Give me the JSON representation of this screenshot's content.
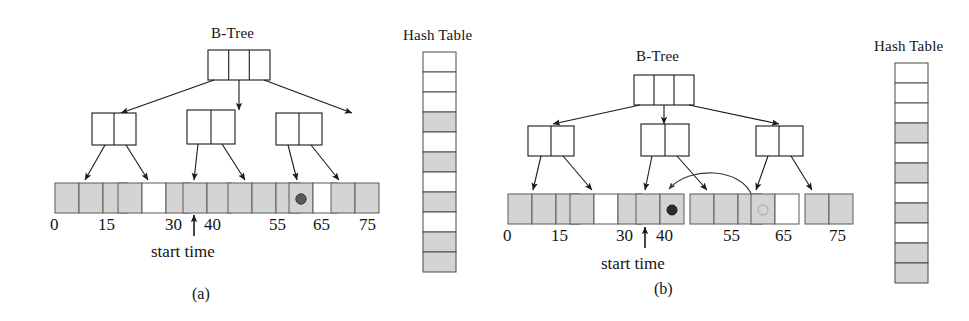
{
  "figure": {
    "type": "diagram",
    "background_color": "#ffffff",
    "ink_color": "#1a1a1a",
    "cell_fill_gray": "#d4d4d4",
    "cell_fill_white": "#ffffff",
    "dot_color": "#3a3a3a",
    "panels": [
      {
        "id": "a",
        "caption": "(a)",
        "btree_label": "B-Tree",
        "hash_label": "Hash Table",
        "start_time_label": "start time",
        "axis_ticks": [
          "0",
          "15",
          "30",
          "40",
          "55",
          "65",
          "75"
        ],
        "root": {
          "slots": 3
        },
        "internal_nodes": [
          {
            "slots": 2
          },
          {
            "slots": 2
          },
          {
            "slots": 2
          }
        ],
        "leaf_blocks": [
          {
            "cells": [
              "gray",
              "gray",
              "gray"
            ]
          },
          {
            "cells": [
              "gray",
              "white",
              "gray"
            ]
          },
          {
            "cells": [
              "gray",
              "gray"
            ]
          },
          {
            "cells": [
              "gray",
              "gray",
              "gray"
            ]
          },
          {
            "cells": [
              "gray",
              "white"
            ],
            "dot_cell_index": 0
          },
          {
            "cells": [
              "gray",
              "gray"
            ]
          }
        ],
        "hash_table_cells": [
          "white",
          "white",
          "white",
          "gray",
          "white",
          "gray",
          "white",
          "gray",
          "white",
          "gray",
          "gray"
        ],
        "has_curved_arrow": false
      },
      {
        "id": "b",
        "caption": "(b)",
        "btree_label": "B-Tree",
        "hash_label": "Hash Table",
        "start_time_label": "start time",
        "axis_ticks": [
          "0",
          "15",
          "30",
          "40",
          "55",
          "65",
          "75"
        ],
        "root": {
          "slots": 3
        },
        "internal_nodes": [
          {
            "slots": 2
          },
          {
            "slots": 2
          },
          {
            "slots": 2
          }
        ],
        "leaf_blocks": [
          {
            "cells": [
              "gray",
              "gray",
              "gray"
            ]
          },
          {
            "cells": [
              "gray",
              "white",
              "gray"
            ]
          },
          {
            "cells": [
              "gray",
              "gray"
            ],
            "dot_cell_index": 1
          },
          {
            "cells": [
              "gray",
              "gray",
              "gray"
            ]
          },
          {
            "cells": [
              "gray",
              "white"
            ],
            "faint_dot_cell_index": 0
          },
          {
            "cells": [
              "gray",
              "gray"
            ]
          }
        ],
        "hash_table_cells": [
          "white",
          "white",
          "white",
          "gray",
          "white",
          "gray",
          "white",
          "gray",
          "white",
          "gray",
          "gray"
        ],
        "has_curved_arrow": true,
        "curved_arrow_note": "curve from the faint-dot leaf cell back to the filled-dot leaf cell"
      }
    ]
  }
}
